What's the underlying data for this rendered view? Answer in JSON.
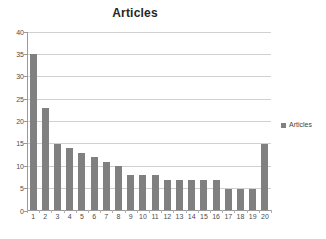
{
  "chart_data": {
    "type": "bar",
    "title": "Articles",
    "xlabel": "",
    "ylabel": "",
    "categories": [
      "1",
      "2",
      "3",
      "4",
      "5",
      "6",
      "7",
      "8",
      "9",
      "10",
      "11",
      "12",
      "13",
      "14",
      "15",
      "16",
      "17",
      "18",
      "19",
      "20"
    ],
    "values": [
      35,
      23,
      15,
      14,
      13,
      12,
      11,
      10,
      8,
      8,
      8,
      7,
      7,
      7,
      7,
      7,
      5,
      5,
      5,
      15
    ],
    "series": [
      {
        "name": "Articles",
        "values": [
          35,
          23,
          15,
          14,
          13,
          12,
          11,
          10,
          8,
          8,
          8,
          7,
          7,
          7,
          7,
          7,
          5,
          5,
          5,
          15
        ],
        "color": "#808080"
      }
    ],
    "ylim": [
      0,
      40
    ],
    "ytick_step": 5,
    "yticks": [
      "40",
      "35",
      "30",
      "25",
      "20",
      "15",
      "10",
      "5",
      "0"
    ],
    "ytick_values": [
      40,
      35,
      30,
      25,
      20,
      15,
      10,
      5,
      0
    ],
    "grid": true,
    "grid_axis": "y",
    "legend": {
      "position": "right",
      "entries": [
        {
          "label": "Articles",
          "marker": "square-marker",
          "color": "#808080"
        }
      ]
    },
    "colors": {
      "bar": "#808080",
      "gridline": "#d0d0d0",
      "axis": "#9a9a9a",
      "title_text": "#262626",
      "tick_text": "#4d4d4d",
      "background": "#ffffff"
    }
  }
}
